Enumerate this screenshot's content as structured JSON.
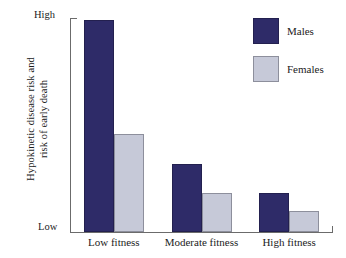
{
  "chart_data": {
    "type": "bar",
    "title": "",
    "subtitle": "",
    "xlabel": "",
    "ylabel_line1": "Hypokinetic disease risk and",
    "ylabel_line2": "risk of early death",
    "categories": [
      "Low fitness",
      "Moderate fitness",
      "High fitness"
    ],
    "series": [
      {
        "name": "Males",
        "color": "#2e2b68",
        "values": [
          99,
          32,
          18
        ]
      },
      {
        "name": "Females",
        "color": "#c6c9d8",
        "values": [
          46,
          18,
          10
        ]
      }
    ],
    "ylim": [
      0,
      100
    ],
    "y_tick_labels": {
      "top": "High",
      "bottom": "Low"
    },
    "y_axis_qualitative": true,
    "grid": false,
    "legend_position": "top-right"
  },
  "legend": {
    "items": [
      {
        "label": "Males",
        "swatch": "males-swatch"
      },
      {
        "label": "Females",
        "swatch": "females-swatch"
      }
    ]
  },
  "axes": {
    "y_top_label": "High",
    "y_bottom_label": "Low"
  },
  "colors": {
    "males": "#2e2b68",
    "females": "#c6c9d8",
    "axis": "#6b6b6b",
    "background": "#ffffff",
    "text": "#1b1b1b"
  }
}
